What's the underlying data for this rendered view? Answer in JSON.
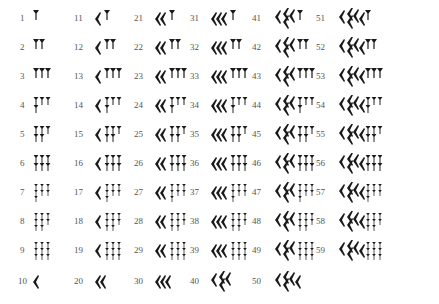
{
  "colors": {
    "ink": "#1a1a1a",
    "label": "#555555",
    "background": "#ffffff"
  },
  "layout": {
    "columns_x": [
      20,
      74,
      134,
      190,
      252,
      316
    ],
    "glyph_offset_x": [
      12,
      20,
      20,
      20,
      22,
      22
    ],
    "rows_y": [
      8,
      37,
      66,
      95,
      124,
      153,
      182,
      211,
      240,
      271
    ]
  },
  "columns": [
    {
      "tens": 0,
      "items": [
        {
          "label": "1",
          "tens": 0,
          "units": 1
        },
        {
          "label": "2",
          "tens": 0,
          "units": 2
        },
        {
          "label": "3",
          "tens": 0,
          "units": 3
        },
        {
          "label": "4",
          "tens": 0,
          "units": 4
        },
        {
          "label": "5",
          "tens": 0,
          "units": 5
        },
        {
          "label": "6",
          "tens": 0,
          "units": 6
        },
        {
          "label": "7",
          "tens": 0,
          "units": 7
        },
        {
          "label": "8",
          "tens": 0,
          "units": 8
        },
        {
          "label": "9",
          "tens": 0,
          "units": 9
        },
        {
          "label": "10",
          "tens": 1,
          "units": 0
        }
      ]
    },
    {
      "tens": 1,
      "items": [
        {
          "label": "11",
          "tens": 1,
          "units": 1
        },
        {
          "label": "12",
          "tens": 1,
          "units": 2
        },
        {
          "label": "13",
          "tens": 1,
          "units": 3
        },
        {
          "label": "14",
          "tens": 1,
          "units": 4
        },
        {
          "label": "15",
          "tens": 1,
          "units": 5
        },
        {
          "label": "16",
          "tens": 1,
          "units": 6
        },
        {
          "label": "17",
          "tens": 1,
          "units": 7
        },
        {
          "label": "18",
          "tens": 1,
          "units": 8
        },
        {
          "label": "19",
          "tens": 1,
          "units": 9
        },
        {
          "label": "20",
          "tens": 2,
          "units": 0
        }
      ]
    },
    {
      "tens": 2,
      "items": [
        {
          "label": "21",
          "tens": 2,
          "units": 1
        },
        {
          "label": "22",
          "tens": 2,
          "units": 2
        },
        {
          "label": "23",
          "tens": 2,
          "units": 3
        },
        {
          "label": "24",
          "tens": 2,
          "units": 4
        },
        {
          "label": "25",
          "tens": 2,
          "units": 5
        },
        {
          "label": "26",
          "tens": 2,
          "units": 6
        },
        {
          "label": "27",
          "tens": 2,
          "units": 7
        },
        {
          "label": "28",
          "tens": 2,
          "units": 8
        },
        {
          "label": "29",
          "tens": 2,
          "units": 9
        },
        {
          "label": "30",
          "tens": 3,
          "units": 0
        }
      ]
    },
    {
      "tens": 3,
      "items": [
        {
          "label": "31",
          "tens": 3,
          "units": 1
        },
        {
          "label": "32",
          "tens": 3,
          "units": 2
        },
        {
          "label": "33",
          "tens": 3,
          "units": 3
        },
        {
          "label": "34",
          "tens": 3,
          "units": 4
        },
        {
          "label": "35",
          "tens": 3,
          "units": 5
        },
        {
          "label": "36",
          "tens": 3,
          "units": 6
        },
        {
          "label": "37",
          "tens": 3,
          "units": 7
        },
        {
          "label": "38",
          "tens": 3,
          "units": 8
        },
        {
          "label": "39",
          "tens": 3,
          "units": 9
        },
        {
          "label": "40",
          "tens": 4,
          "units": 0
        }
      ]
    },
    {
      "tens": 4,
      "items": [
        {
          "label": "41",
          "tens": 4,
          "units": 1
        },
        {
          "label": "42",
          "tens": 4,
          "units": 2
        },
        {
          "label": "43",
          "tens": 4,
          "units": 3
        },
        {
          "label": "44",
          "tens": 4,
          "units": 4
        },
        {
          "label": "45",
          "tens": 4,
          "units": 5
        },
        {
          "label": "46",
          "tens": 4,
          "units": 6
        },
        {
          "label": "47",
          "tens": 4,
          "units": 7
        },
        {
          "label": "48",
          "tens": 4,
          "units": 8
        },
        {
          "label": "49",
          "tens": 4,
          "units": 9
        },
        {
          "label": "50",
          "tens": 5,
          "units": 0
        }
      ]
    },
    {
      "tens": 5,
      "items": [
        {
          "label": "51",
          "tens": 5,
          "units": 1
        },
        {
          "label": "52",
          "tens": 5,
          "units": 2
        },
        {
          "label": "53",
          "tens": 5,
          "units": 3
        },
        {
          "label": "54",
          "tens": 5,
          "units": 4
        },
        {
          "label": "55",
          "tens": 5,
          "units": 5
        },
        {
          "label": "56",
          "tens": 5,
          "units": 6
        },
        {
          "label": "57",
          "tens": 5,
          "units": 7
        },
        {
          "label": "58",
          "tens": 5,
          "units": 8
        },
        {
          "label": "59",
          "tens": 5,
          "units": 9
        }
      ]
    }
  ]
}
